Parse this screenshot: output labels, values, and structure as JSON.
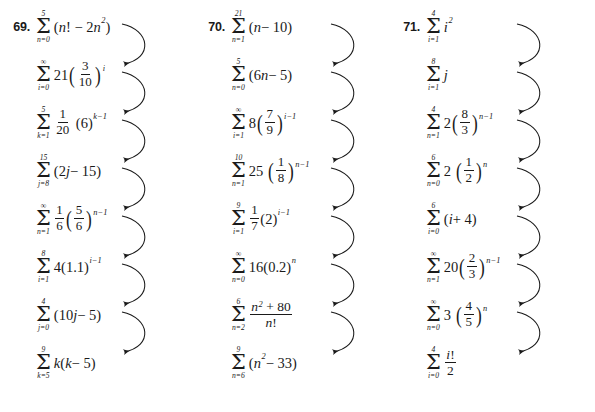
{
  "page": {
    "type": "math-exercise-matching-page",
    "background_color": "#ffffff",
    "ink_color": "#1a1a1a",
    "columns_count": 3,
    "rows_per_column": 8,
    "arrows_per_column": 7,
    "arrow_style": "curved-right-bulge-pointing-left"
  },
  "columns": [
    {
      "number_label": "69.",
      "rows": [
        {
          "sigma_top": "5",
          "sigma_bottom": "n=0",
          "body": "(n! − 2n²)",
          "plain": "sum n=0 to 5 of (n! - 2n^2)"
        },
        {
          "sigma_top": "∞",
          "sigma_bottom": "i=0",
          "body": "21(3/10)^i",
          "plain": "sum i=0 to infinity of 21(3/10)^i"
        },
        {
          "sigma_top": "5",
          "sigma_bottom": "k=1",
          "body": "1/20 (6)^(k−1)",
          "plain": "sum k=1 to 5 of (1/20)(6)^(k-1)"
        },
        {
          "sigma_top": "15",
          "sigma_bottom": "j=8",
          "body": "(2j − 15)",
          "plain": "sum j=8 to 15 of (2j - 15)"
        },
        {
          "sigma_top": "∞",
          "sigma_bottom": "n=1",
          "body": "1/6 (5/6)^(n−1)",
          "plain": "sum n=1 to infinity of (1/6)(5/6)^(n-1)"
        },
        {
          "sigma_top": "8",
          "sigma_bottom": "i=1",
          "body": "4(1.1)^(i−1)",
          "plain": "sum i=1 to 8 of 4(1.1)^(i-1)"
        },
        {
          "sigma_top": "4",
          "sigma_bottom": "j=0",
          "body": "(10j − 5)",
          "plain": "sum j=0 to 4 of (10j - 5)"
        },
        {
          "sigma_top": "9",
          "sigma_bottom": "k=5",
          "body": "k(k − 5)",
          "plain": "sum k=5 to 9 of k(k - 5)"
        }
      ]
    },
    {
      "number_label": "70.",
      "rows": [
        {
          "sigma_top": "21",
          "sigma_bottom": "n=1",
          "body": "(n − 10)",
          "plain": "sum n=1 to 21 of (n - 10)"
        },
        {
          "sigma_top": "5",
          "sigma_bottom": "n=0",
          "body": "(6n − 5)",
          "plain": "sum n=0 to 5 of (6n - 5)"
        },
        {
          "sigma_top": "∞",
          "sigma_bottom": "i=1",
          "body": "8(7/9)^(i−1)",
          "plain": "sum i=1 to infinity of 8(7/9)^(i-1)"
        },
        {
          "sigma_top": "10",
          "sigma_bottom": "n=1",
          "body": "25(1/8)^(n−1)",
          "plain": "sum n=1 to 10 of 25(1/8)^(n-1)"
        },
        {
          "sigma_top": "9",
          "sigma_bottom": "i=1",
          "body": "1/7 (2)^(i−1)",
          "plain": "sum i=1 to 9 of (1/7)(2)^(i-1)"
        },
        {
          "sigma_top": "∞",
          "sigma_bottom": "n=0",
          "body": "16(0.2)^n",
          "plain": "sum n=0 to infinity of 16(0.2)^n"
        },
        {
          "sigma_top": "6",
          "sigma_bottom": "n=2",
          "body": "(n² + 80)/n!",
          "plain": "sum n=2 to 6 of (n^2 + 80)/n!"
        },
        {
          "sigma_top": "9",
          "sigma_bottom": "n=6",
          "body": "(n² − 33)",
          "plain": "sum n=6 to 9 of (n^2 - 33)"
        }
      ]
    },
    {
      "number_label": "71.",
      "rows": [
        {
          "sigma_top": "4",
          "sigma_bottom": "i=1",
          "body": "i²",
          "plain": "sum i=1 to 4 of i^2"
        },
        {
          "sigma_top": "8",
          "sigma_bottom": "i=1",
          "body": "j",
          "plain": "sum i=1 to 8 of j"
        },
        {
          "sigma_top": "4",
          "sigma_bottom": "n=1",
          "body": "2(8/3)^(n−1)",
          "plain": "sum n=1 to 4 of 2(8/3)^(n-1)"
        },
        {
          "sigma_top": "6",
          "sigma_bottom": "n=0",
          "body": "2(1/2)^n",
          "plain": "sum n=0 to 6 of 2(1/2)^n"
        },
        {
          "sigma_top": "6",
          "sigma_bottom": "i=0",
          "body": "(i + 4)",
          "plain": "sum i=0 to 6 of (i + 4)"
        },
        {
          "sigma_top": "∞",
          "sigma_bottom": "n=1",
          "body": "20(2/3)^(n−1)",
          "plain": "sum n=1 to infinity of 20(2/3)^(n-1)"
        },
        {
          "sigma_top": "∞",
          "sigma_bottom": "n=0",
          "body": "3(4/5)^n",
          "plain": "sum n=0 to infinity of 3(4/5)^n"
        },
        {
          "sigma_top": "4",
          "sigma_bottom": "i=0",
          "body": "i!/2",
          "plain": "sum i=0 to 4 of i!/2"
        }
      ]
    }
  ],
  "glyphs": {
    "sigma": "Σ",
    "infinity": "∞",
    "minus": "−",
    "plus": "+",
    "factorial": "!"
  }
}
